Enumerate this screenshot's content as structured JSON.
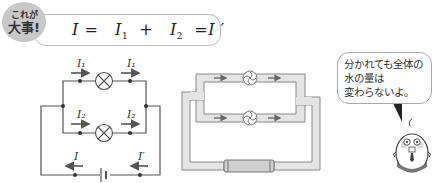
{
  "badge": {
    "line1": "これが",
    "line2": "大事!"
  },
  "formula": {
    "lhs": "I",
    "eq1": "=",
    "term1": "I",
    "term1_sub": "1",
    "plus": "+",
    "term2": "I",
    "term2_sub": "2",
    "eq2": "=",
    "rhs": "I ′"
  },
  "circuit": {
    "labels": {
      "top_left": "I₁",
      "top_right": "I₁",
      "bottom_left": "I₂",
      "bottom_right": "I₂",
      "source_left": "I",
      "source_right": "I′"
    }
  },
  "speech_bubble": {
    "lines": [
      "分かれても全体の",
      "水の量は",
      "変わらないよ。"
    ]
  },
  "colors": {
    "wire": "#555555",
    "pipe_fill": "#e4e4e4",
    "pipe_edge": "#8a8a8a",
    "badge_bg": "#c8c8c8",
    "text": "#222222"
  }
}
